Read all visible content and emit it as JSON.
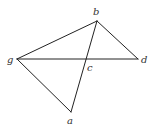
{
  "diagram": {
    "type": "geometric-figure",
    "points": {
      "b": {
        "label": "b",
        "x": 97,
        "y": 21,
        "lx": 93,
        "ly": 15
      },
      "g": {
        "label": "g",
        "x": 17,
        "y": 59,
        "lx": 7,
        "ly": 63
      },
      "d": {
        "label": "d",
        "x": 138,
        "y": 59,
        "lx": 141,
        "ly": 63
      },
      "a": {
        "label": "a",
        "x": 71,
        "y": 112,
        "lx": 67,
        "ly": 124
      },
      "c": {
        "label": "c",
        "x": 86,
        "y": 59,
        "lx": 87,
        "ly": 71
      }
    },
    "segments": [
      {
        "from": "g",
        "to": "b"
      },
      {
        "from": "b",
        "to": "d"
      },
      {
        "from": "g",
        "to": "d"
      },
      {
        "from": "g",
        "to": "a"
      },
      {
        "from": "a",
        "to": "b"
      }
    ],
    "line_color": "#222222"
  }
}
